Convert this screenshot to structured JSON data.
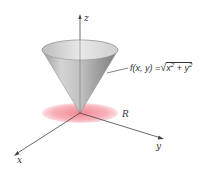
{
  "figure": {
    "type": "3d-surface-diagram",
    "surface": "cone",
    "axes": {
      "z_label": "z",
      "x_label": "x",
      "y_label": "y"
    },
    "region_label": "R",
    "function_label": {
      "lhs": "f(x, y) =",
      "radical": "√",
      "radicand_a": "x",
      "exp_a": "2",
      "plus": " + ",
      "radicand_b": "y",
      "exp_b": "2"
    },
    "colors": {
      "cone_light": "#e6e6e6",
      "cone_dark": "#8c8c8c",
      "region": "#f28b96",
      "axis": "#444444"
    }
  }
}
